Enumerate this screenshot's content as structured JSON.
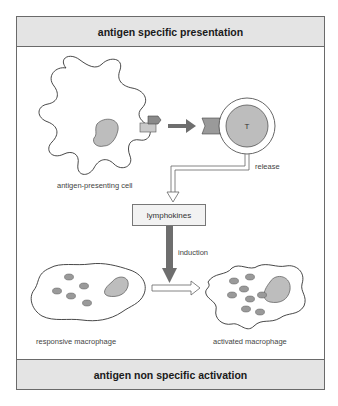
{
  "header": {
    "title": "antigen specific presentation"
  },
  "footer": {
    "title": "antigen non specific activation"
  },
  "cells": {
    "apc": {
      "label": "antigen-presenting cell"
    },
    "t_cell": {
      "letter": "T",
      "release_label": "release"
    },
    "responsive": {
      "label": "responsive macrophage"
    },
    "activated": {
      "label": "activated macrophage"
    }
  },
  "process": {
    "lymphokines_label": "lymphokines",
    "induction_label": "induction"
  },
  "colors": {
    "band_fill": "#e4e4e4",
    "cell_fill": "#bdbdbd",
    "arrow_dark": "#6e6e6e",
    "outline": "#333333"
  }
}
